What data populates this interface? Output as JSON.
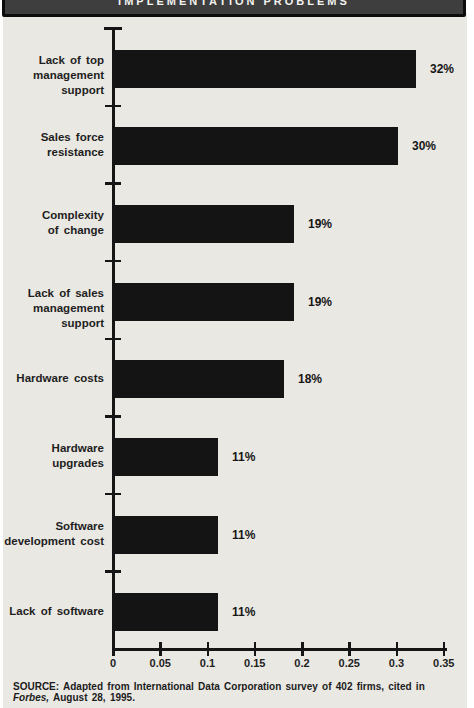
{
  "header": {
    "title": "IMPLEMENTATION PROBLEMS"
  },
  "chart_data": {
    "type": "bar",
    "orientation": "horizontal",
    "title": "IMPLEMENTATION PROBLEMS",
    "categories": [
      "Lack of top management support",
      "Sales force resistance",
      "Complexity of change",
      "Lack of sales management support",
      "Hardware costs",
      "Hardware upgrades",
      "Software development cost",
      "Lack of software"
    ],
    "category_lines": [
      [
        "Lack of top",
        "management support"
      ],
      [
        "Sales force",
        "resistance"
      ],
      [
        "Complexity",
        "of change"
      ],
      [
        "Lack of sales",
        "management support"
      ],
      [
        "Hardware costs"
      ],
      [
        "Hardware",
        "upgrades"
      ],
      [
        "Software",
        "development cost"
      ],
      [
        "Lack of software"
      ]
    ],
    "values": [
      0.32,
      0.3,
      0.19,
      0.19,
      0.18,
      0.11,
      0.11,
      0.11
    ],
    "value_labels": [
      "32%",
      "30%",
      "19%",
      "19%",
      "18%",
      "11%",
      "11%",
      "11%"
    ],
    "xlim": [
      0,
      0.35
    ],
    "x_ticks": [
      "0",
      "0.05",
      "0.1",
      "0.15",
      "0.2",
      "0.25",
      "0.3",
      "0.35"
    ],
    "xlabel": "",
    "ylabel": "",
    "grid": false,
    "legend": "none",
    "bar_color": "#141414"
  },
  "source": {
    "label": "SOURCE:",
    "pre": " Adapted from International Data Corporation survey of 402 firms, cited in ",
    "italic": "Forbes,",
    "post": " August 28, 1995."
  },
  "colors": {
    "paper_bg": "#eae8e3",
    "page_bg": "#ffffff",
    "header_fill": "#3e3e3e",
    "header_border": "#0c0c0c",
    "bar": "#141414",
    "text": "#1e1e1e"
  }
}
